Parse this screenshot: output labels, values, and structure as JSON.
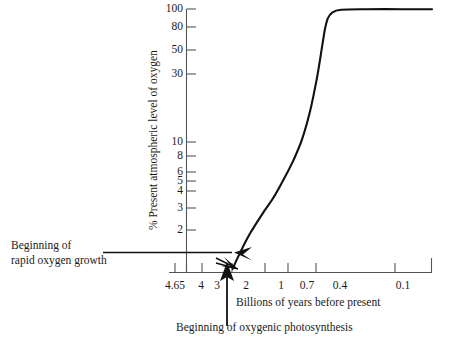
{
  "chart_data": {
    "type": "line",
    "title": "",
    "xlabel": "Billions of years before present",
    "ylabel": "% Present atmospheric level of oxygen",
    "x_scale": "log-reversed",
    "y_scale": "log",
    "xlim": [
      4.65,
      0.06
    ],
    "ylim": [
      1.4,
      100
    ],
    "grid": false,
    "legend": null,
    "x_ticks": [
      "4.65",
      "4",
      "3",
      "2",
      "1",
      "0.7",
      "0.4",
      "0.1"
    ],
    "x_tick_values": [
      4.65,
      4,
      3,
      2,
      1,
      0.7,
      0.4,
      0.1
    ],
    "y_ticks": [
      "100",
      "80",
      "50",
      "30",
      "10",
      "8",
      "6",
      "5",
      "4",
      "3",
      "2"
    ],
    "y_tick_values": [
      100,
      80,
      50,
      30,
      10,
      8,
      6,
      5,
      4,
      3,
      2
    ],
    "series": [
      {
        "name": "Atmospheric oxygen",
        "x": [
          2.05,
          1.9,
          1.7,
          1.5,
          1.2,
          1.0,
          0.85,
          0.7,
          0.6,
          0.52,
          0.46,
          0.42,
          0.4,
          0.38,
          0.35,
          0.3,
          0.2,
          0.1,
          0.06
        ],
        "y": [
          1.45,
          1.7,
          2.1,
          2.6,
          3.6,
          4.6,
          6.0,
          8.5,
          12,
          19,
          33,
          55,
          72,
          86,
          95,
          99,
          100,
          100,
          100
        ]
      }
    ],
    "annotations": [
      {
        "name": "rapid-oxygen-growth",
        "line1": "Beginning of",
        "line2": "rapid oxygen growth",
        "points_to_x": 2.05,
        "points_to_y": 1.45
      },
      {
        "name": "oxygenic-photosynthesis",
        "text": "Beginning of oxygenic photosynthesis",
        "points_to_x": 2.3,
        "points_to_y": 1.4
      }
    ]
  },
  "axes": {
    "x_title": "Billions of years before present",
    "y_title": "% Present atmospheric level of oxygen"
  },
  "annotations": {
    "rapid_growth_line1": "Beginning of",
    "rapid_growth_line2": "rapid oxygen growth",
    "photosynthesis": "Beginning of oxygenic photosynthesis"
  },
  "colors": {
    "curve": "#111111",
    "axis": "#444444",
    "text": "#1a1a1a",
    "background": "#ffffff"
  }
}
